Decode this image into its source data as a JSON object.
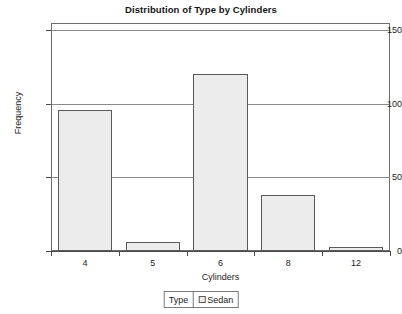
{
  "chart_data": {
    "type": "bar",
    "title": "Distribution of Type by Cylinders",
    "xlabel": "Cylinders",
    "ylabel": "Frequency",
    "categories": [
      "4",
      "5",
      "6",
      "8",
      "12"
    ],
    "values": [
      96,
      6,
      120,
      38,
      3
    ],
    "series": [
      {
        "name": "Sedan",
        "values": [
          96,
          6,
          120,
          38,
          3
        ]
      }
    ],
    "yticks": [
      0,
      50,
      100,
      150
    ],
    "ytick_labels": [
      "0",
      "50",
      "100",
      "150"
    ],
    "ylim": [
      0,
      155
    ],
    "xlim": [
      0,
      5
    ],
    "grid": true,
    "grid_axis": "y",
    "legend_position": "bottom-center",
    "bar_fill_color": "#ececec",
    "bar_border_color": "#595959",
    "grid_color": "#8a8a8a",
    "axis_color": "#4a4a4a",
    "background_color": "#ffffff",
    "text_color": "#1c1c1c"
  },
  "legend": {
    "title": "Type",
    "entries": [
      {
        "label": "Sedan",
        "swatch_color": "#ececec"
      }
    ]
  }
}
